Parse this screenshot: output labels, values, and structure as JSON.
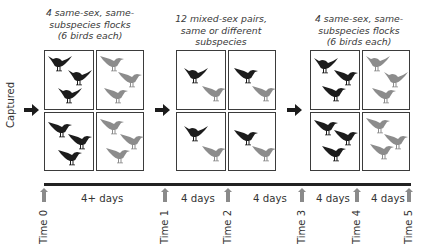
{
  "side_label": "Captured",
  "colors": {
    "dark_bird": "#1c1c1c",
    "light_bird": "#8c8c8c",
    "time_arrow": "#8a8a8a",
    "box_border": "#3b3b3b"
  },
  "phases": [
    {
      "caption_lines": [
        "4 same-sex, same-",
        "subspecies flocks",
        "(6 birds each)"
      ]
    },
    {
      "caption_lines": [
        "12 mixed-sex pairs,",
        "same or different",
        "subspecies"
      ]
    },
    {
      "caption_lines": [
        "4 same-sex, same-",
        "subspecies flocks",
        "(6 birds each)"
      ]
    }
  ],
  "timeline": {
    "time_points": [
      "Time 0",
      "Time 1",
      "Time 2",
      "Time 3",
      "Time 4",
      "Time 5"
    ],
    "intervals": [
      "4+ days",
      "4 days",
      "4 days",
      "4 days",
      "4 days"
    ]
  },
  "icons": {
    "bird": "bird-silhouette-icon",
    "arrow": "right-arrow-icon",
    "time_marker": "up-arrow-icon"
  }
}
